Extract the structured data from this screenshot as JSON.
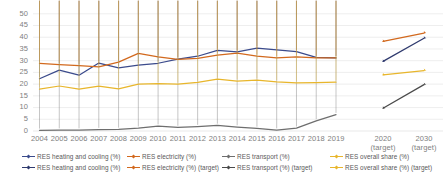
{
  "chart_data": {
    "type": "line",
    "title": "",
    "xlabel": "",
    "ylabel": "",
    "ylim": [
      0,
      50
    ],
    "yticks": [
      0,
      5,
      10,
      15,
      20,
      25,
      30,
      35,
      40,
      45,
      50
    ],
    "grid": true,
    "legend_position": "bottom",
    "categories": [
      "2004",
      "2005",
      "2006",
      "2007",
      "2008",
      "2009",
      "2010",
      "2011",
      "2012",
      "2013",
      "2014",
      "2015",
      "2016",
      "2017",
      "2018",
      "2019"
    ],
    "target_categories": [
      "2020",
      "2030"
    ],
    "target_sub_label": "(target)",
    "series": [
      {
        "name": "RES heating and cooling (%)",
        "color": "#3B4B8C",
        "values": [
          22.3,
          26.0,
          23.8,
          29.0,
          26.9,
          28.1,
          28.9,
          30.7,
          31.9,
          34.4,
          33.8,
          35.4,
          34.6,
          33.9,
          31.4,
          31.2
        ]
      },
      {
        "name": "RES electricity (%)",
        "color": "#D2691E",
        "values": [
          28.8,
          28.3,
          27.9,
          27.4,
          29.4,
          33.1,
          31.6,
          30.6,
          31.0,
          32.4,
          33.2,
          31.9,
          31.2,
          31.6,
          31.2,
          31.2
        ]
      },
      {
        "name": "RES transport (%)",
        "color": "#6E6E6E",
        "values": [
          0.3,
          0.4,
          0.4,
          0.6,
          0.7,
          1.2,
          2.1,
          1.5,
          1.9,
          2.4,
          1.7,
          1.1,
          0.4,
          1.2,
          4.3,
          7.0
        ]
      },
      {
        "name": "RES overall share (%)",
        "color": "#E8B62C",
        "values": [
          17.9,
          19.2,
          17.9,
          19.1,
          18.0,
          20.0,
          20.2,
          20.0,
          20.7,
          22.1,
          21.3,
          21.7,
          21.0,
          20.5,
          20.6,
          20.8
        ]
      }
    ],
    "target_series": [
      {
        "name": "RES heating and cooling (%) (target)",
        "color": "#2F3A6E",
        "values": [
          29.7,
          39.6
        ]
      },
      {
        "name": "RES electricity (%) (target)",
        "color": "#D2691E",
        "values": [
          38.2,
          41.8
        ]
      },
      {
        "name": "RES transport (%) (target)",
        "color": "#4A4A4A",
        "values": [
          9.7,
          19.8
        ]
      },
      {
        "name": "RES overall share (%) (target)",
        "color": "#E8B62C",
        "values": [
          23.9,
          25.8
        ]
      }
    ]
  },
  "legend": {
    "row1": [
      {
        "label": "RES heating and cooling (%)",
        "color": "#3B4B8C"
      },
      {
        "label": "RES electricity (%)",
        "color": "#D2691E"
      },
      {
        "label": "RES transport (%)",
        "color": "#6E6E6E"
      },
      {
        "label": "RES overall share (%)",
        "color": "#E8B62C"
      }
    ],
    "row2": [
      {
        "label": "RES heating and cooling (%)",
        "color": "#2F3A6E"
      },
      {
        "label": "RES electricity (%) (target)",
        "color": "#D2691E"
      },
      {
        "label": "RES transport (%) (target)",
        "color": "#4A4A4A"
      },
      {
        "label": "RES overall share (%) (target)",
        "color": "#E8B62C"
      }
    ]
  }
}
